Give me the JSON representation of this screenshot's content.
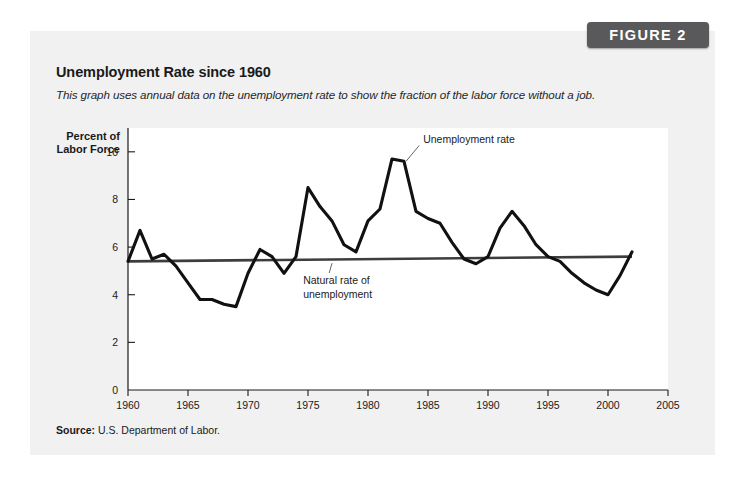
{
  "badge": {
    "label": "FIGURE 2"
  },
  "title": "Unemployment Rate since 1960",
  "subtitle": "This graph uses annual data on the unemployment rate to show the fraction of the labor force without a job.",
  "source": {
    "label": "Source:",
    "text": "U.S. Department of Labor."
  },
  "colors": {
    "badge_bg": "#59595b",
    "card_bg": "#f1f1f1",
    "plot_bg": "#ffffff",
    "unemployment_line": "#111111",
    "natural_rate_line": "#3d3d3d",
    "axis": "#1a1a1a"
  },
  "chart_data": {
    "type": "line",
    "title": "Unemployment Rate since 1960",
    "xlabel": "",
    "ylabel": "Percent of Labor Force",
    "ylabel_line1": "Percent of",
    "ylabel_line2": "Labor Force",
    "xlim": [
      1960,
      2005
    ],
    "ylim": [
      0,
      11
    ],
    "xticks": [
      1960,
      1965,
      1970,
      1975,
      1980,
      1985,
      1990,
      1995,
      2000,
      2005
    ],
    "xtick_labels": [
      "1960",
      "1965",
      "1970",
      "1975",
      "1980",
      "1985",
      "1990",
      "1995",
      "2000",
      "2005"
    ],
    "yticks": [
      0,
      2,
      4,
      6,
      8,
      10
    ],
    "ytick_labels": [
      "0",
      "2",
      "4",
      "6",
      "8",
      "10"
    ],
    "grid": false,
    "legend": "annotations",
    "annotations": [
      {
        "name": "unemployment-rate",
        "text": "Unemployment rate",
        "text_x": 1984.6,
        "text_y": 10.35,
        "point_x": 1983.0,
        "point_y": 9.6
      },
      {
        "name": "natural-rate",
        "text_line1": "Natural rate of",
        "text_line2": "unemployment",
        "text_x": 1974.6,
        "text_y": 4.45,
        "point_x": 1977.0,
        "point_y": 5.45
      }
    ],
    "series": [
      {
        "name": "Unemployment rate",
        "x": [
          1960,
          1961,
          1962,
          1963,
          1964,
          1965,
          1966,
          1967,
          1968,
          1969,
          1970,
          1971,
          1972,
          1973,
          1974,
          1975,
          1976,
          1977,
          1978,
          1979,
          1980,
          1981,
          1982,
          1983,
          1984,
          1985,
          1986,
          1987,
          1988,
          1989,
          1990,
          1991,
          1992,
          1993,
          1994,
          1995,
          1996,
          1997,
          1998,
          1999,
          2000,
          2001,
          2002
        ],
        "values": [
          5.4,
          6.7,
          5.5,
          5.7,
          5.2,
          4.5,
          3.8,
          3.8,
          3.6,
          3.5,
          4.9,
          5.9,
          5.6,
          4.9,
          5.6,
          8.5,
          7.7,
          7.1,
          6.1,
          5.8,
          7.1,
          7.6,
          9.7,
          9.6,
          7.5,
          7.2,
          7.0,
          6.2,
          5.5,
          5.3,
          5.6,
          6.8,
          7.5,
          6.9,
          6.1,
          5.6,
          5.4,
          4.9,
          4.5,
          4.2,
          4.0,
          4.8,
          5.8
        ]
      },
      {
        "name": "Natural rate of unemployment",
        "x": [
          1960,
          2002
        ],
        "values": [
          5.4,
          5.6
        ]
      }
    ]
  }
}
